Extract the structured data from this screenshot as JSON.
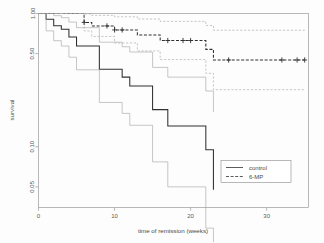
{
  "chart_data": {
    "type": "line",
    "title": "",
    "subtitle": "",
    "xlabel": "time of remission (weeks)",
    "ylabel": "survival",
    "yscale": "log",
    "xlim": [
      0,
      35.5
    ],
    "ylim": [
      0.035,
      1.0
    ],
    "grid": false,
    "xticks": [
      0,
      10,
      20,
      30
    ],
    "xtick_labels": [
      "0",
      "10",
      "20",
      "30"
    ],
    "yticks": [
      1.0,
      0.5,
      0.1,
      0.05
    ],
    "ytick_labels": [
      "1.00",
      "0.50",
      "0.10",
      "0.05"
    ],
    "legend": {
      "position": "bottom-right",
      "entries": [
        {
          "label": "control",
          "style": "solid"
        },
        {
          "label": "6-MP",
          "style": "dashed"
        }
      ]
    },
    "series": [
      {
        "name": "control",
        "style": "solid",
        "role": "estimate",
        "steps_x": [
          0,
          1,
          1,
          2,
          2,
          3,
          3,
          4,
          4,
          5,
          5,
          8,
          8,
          11,
          11,
          12,
          12,
          15,
          15,
          17,
          17,
          22,
          22,
          23,
          23
        ],
        "steps_y": [
          1.0,
          1.0,
          0.905,
          0.905,
          0.81,
          0.81,
          0.762,
          0.762,
          0.667,
          0.667,
          0.571,
          0.571,
          0.381,
          0.381,
          0.333,
          0.333,
          0.286,
          0.286,
          0.19,
          0.19,
          0.143,
          0.143,
          0.095,
          0.095,
          0.0476
        ]
      },
      {
        "name": "control-upper-ci",
        "style": "solid",
        "role": "upper-band",
        "steps_x": [
          0,
          1,
          1,
          2,
          2,
          3,
          3,
          4,
          4,
          5,
          5,
          8,
          8,
          11,
          11,
          12,
          12,
          15,
          15,
          17,
          17,
          22,
          22,
          23,
          23
        ],
        "steps_y": [
          1.0,
          1.0,
          1.0,
          1.0,
          0.963,
          0.963,
          0.93,
          0.93,
          0.862,
          0.862,
          0.783,
          0.783,
          0.609,
          0.609,
          0.563,
          0.563,
          0.514,
          0.514,
          0.394,
          0.394,
          0.333,
          0.333,
          0.262,
          0.262,
          0.182
        ]
      },
      {
        "name": "control-lower-ci",
        "style": "solid",
        "role": "lower-band",
        "steps_x": [
          0,
          1,
          1,
          2,
          2,
          3,
          3,
          4,
          4,
          5,
          5,
          8,
          8,
          11,
          11,
          12,
          12,
          15,
          15,
          17,
          17,
          22,
          22,
          23,
          23
        ],
        "steps_y": [
          1.0,
          1.0,
          0.741,
          0.741,
          0.625,
          0.625,
          0.57,
          0.57,
          0.47,
          0.47,
          0.378,
          0.378,
          0.215,
          0.215,
          0.178,
          0.178,
          0.145,
          0.145,
          0.077,
          0.077,
          0.05,
          0.05,
          0.0245,
          0.0245,
          0.0105
        ]
      },
      {
        "name": "6-MP",
        "style": "dashed",
        "role": "estimate",
        "steps_x": [
          0,
          6,
          6,
          7,
          7,
          10,
          10,
          13,
          13,
          16,
          16,
          22,
          22,
          23,
          23,
          35
        ],
        "steps_y": [
          1.0,
          1.0,
          0.857,
          0.857,
          0.807,
          0.807,
          0.753,
          0.753,
          0.69,
          0.69,
          0.627,
          0.627,
          0.538,
          0.538,
          0.448,
          0.448,
          0.448
        ]
      },
      {
        "name": "6-MP-upper-ci",
        "style": "dashed",
        "role": "upper-band",
        "steps_x": [
          0,
          6,
          6,
          7,
          7,
          10,
          10,
          13,
          13,
          16,
          16,
          22,
          22,
          23,
          23,
          35
        ],
        "steps_y": [
          1.0,
          1.0,
          0.992,
          0.992,
          0.968,
          0.968,
          0.945,
          0.945,
          0.909,
          0.909,
          0.873,
          0.873,
          0.813,
          0.813,
          0.749,
          0.749,
          0.749
        ]
      },
      {
        "name": "6-MP-lower-ci",
        "style": "dashed",
        "role": "lower-band",
        "steps_x": [
          0,
          6,
          6,
          7,
          7,
          10,
          10,
          13,
          13,
          16,
          16,
          22,
          22,
          23,
          23,
          35
        ],
        "steps_y": [
          1.0,
          1.0,
          0.74,
          0.74,
          0.673,
          0.673,
          0.601,
          0.601,
          0.524,
          0.524,
          0.451,
          0.451,
          0.356,
          0.356,
          0.268,
          0.268,
          0.268
        ]
      }
    ],
    "censored": [
      {
        "series": "6-MP",
        "x": 6,
        "y": 0.857
      },
      {
        "series": "6-MP",
        "x": 9,
        "y": 0.807
      },
      {
        "series": "6-MP",
        "x": 10,
        "y": 0.753
      },
      {
        "series": "6-MP",
        "x": 11,
        "y": 0.753
      },
      {
        "series": "6-MP",
        "x": 17,
        "y": 0.627
      },
      {
        "series": "6-MP",
        "x": 19,
        "y": 0.627
      },
      {
        "series": "6-MP",
        "x": 20,
        "y": 0.627
      },
      {
        "series": "6-MP",
        "x": 25,
        "y": 0.448
      },
      {
        "series": "6-MP",
        "x": 32,
        "y": 0.448
      },
      {
        "series": "6-MP",
        "x": 34,
        "y": 0.448
      },
      {
        "series": "6-MP",
        "x": 35,
        "y": 0.448
      }
    ],
    "colors": {
      "estimate": "#303030",
      "band": "#a8a8a8",
      "frame": "#9a9a9a",
      "background": "#fdfdfd",
      "text": "#4a4a4a"
    }
  }
}
